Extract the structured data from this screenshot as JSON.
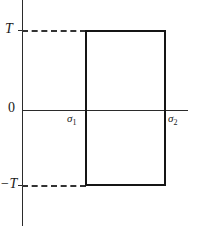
{
  "figure": {
    "background_color": "#ffffff",
    "axis_color": "#2b2b2b",
    "curve_color": "#151515",
    "dash_color": "#333333",
    "caption": ""
  },
  "labels": {
    "y_top": "T",
    "y_bottom": "−T",
    "origin": "0",
    "x_first_base": "σ",
    "x_first_sub": "1",
    "x_second_base": "σ",
    "x_second_sub": "2"
  },
  "chart_data": {
    "type": "line",
    "title": "",
    "xlabel": "",
    "ylabel": "",
    "x": [
      "σ₁",
      "σ₁",
      "σ₂",
      "σ₂"
    ],
    "series": [
      {
        "name": "pulse",
        "values": [
          "T",
          "T",
          "-T",
          "-T"
        ]
      }
    ],
    "y_ticks": [
      "T",
      "0",
      "−T"
    ],
    "y_tick_values": [
      1,
      0,
      -1
    ],
    "x_ticks": [
      "σ₁",
      "σ₂"
    ],
    "xlim": [
      "0",
      "beyond σ₂"
    ],
    "ylim": [
      "−T",
      "T"
    ],
    "grid": false,
    "legend": "none",
    "annotations": [
      {
        "text": "dashed leader from T tick to top of pulse",
        "level": "T"
      },
      {
        "text": "dashed leader from −T tick to bottom of pulse",
        "level": "-T"
      }
    ]
  }
}
